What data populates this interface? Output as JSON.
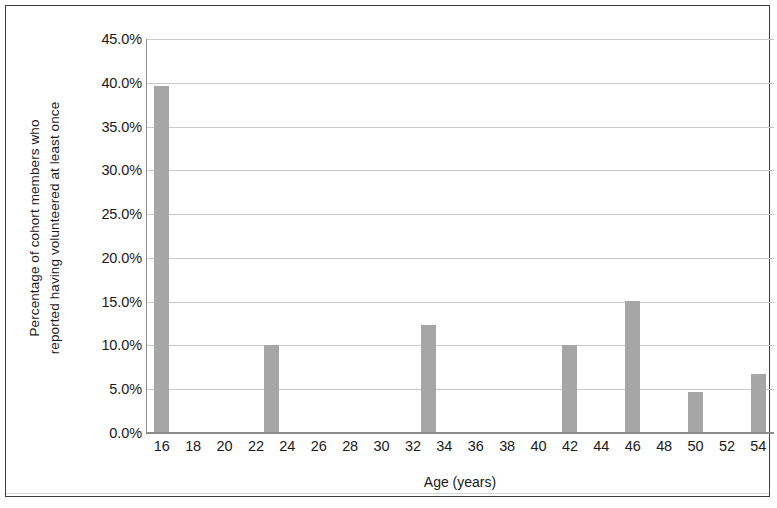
{
  "chart_data": {
    "type": "bar",
    "title": "",
    "subtitle": "",
    "xlabel": "Age (years)",
    "ylabel": "Percentage of cohort members who\nreported having volunteered at least once",
    "x": [
      16,
      23,
      33,
      42,
      46,
      50,
      54
    ],
    "values": [
      39.6,
      10.0,
      12.3,
      10.0,
      15.1,
      4.7,
      6.7
    ],
    "value_unit": "%",
    "categories": [
      "16",
      "23",
      "33",
      "42",
      "46",
      "50",
      "54"
    ],
    "series": [
      {
        "name": "Percentage volunteered at least once",
        "values": [
          39.6,
          10.0,
          12.3,
          10.0,
          15.1,
          4.7,
          6.7
        ]
      }
    ],
    "bar_color": "#a6a6a6",
    "xlim": [
      15,
      55
    ],
    "ylim": [
      0,
      45
    ],
    "ytick_values": [
      0,
      5,
      10,
      15,
      20,
      25,
      30,
      35,
      40,
      45
    ],
    "ytick_labels": [
      "0.0%",
      "5.0%",
      "10.0%",
      "15.0%",
      "20.0%",
      "25.0%",
      "30.0%",
      "35.0%",
      "40.0%",
      "45.0%"
    ],
    "xtick_values": [
      16,
      18,
      20,
      22,
      24,
      26,
      28,
      30,
      32,
      34,
      36,
      38,
      40,
      42,
      44,
      46,
      48,
      50,
      52,
      54
    ],
    "xtick_labels": [
      "16",
      "18",
      "20",
      "22",
      "24",
      "26",
      "28",
      "30",
      "32",
      "34",
      "36",
      "38",
      "40",
      "42",
      "44",
      "46",
      "48",
      "50",
      "52",
      "54"
    ],
    "grid": {
      "horizontal": true,
      "vertical": false,
      "color": "#c9c9c9"
    },
    "legend": {
      "visible": false,
      "position": "none",
      "entries": []
    },
    "axis_line_color": "#8c8c8c",
    "border_color": "#3d3d3d",
    "background_color": "#ffffff"
  }
}
